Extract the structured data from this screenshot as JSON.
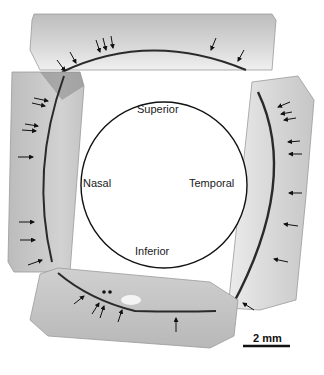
{
  "figure": {
    "orientation_labels": {
      "superior": "Superior",
      "nasal": "Nasal",
      "temporal": "Temporal",
      "inferior": "Inferior"
    },
    "scale_bar": {
      "label": "2 mm"
    },
    "panels": [
      {
        "position": "top",
        "arrow_count": 9
      },
      {
        "position": "left",
        "arrow_count": 9
      },
      {
        "position": "right",
        "arrow_count": 11
      },
      {
        "position": "bottom",
        "arrow_count": 7
      }
    ],
    "colors": {
      "background": "#ffffff",
      "tissue": "#c8c8c8",
      "tissue_dark": "#8a8a8a",
      "band": "#2a2a2a",
      "circle": "#111111"
    }
  }
}
